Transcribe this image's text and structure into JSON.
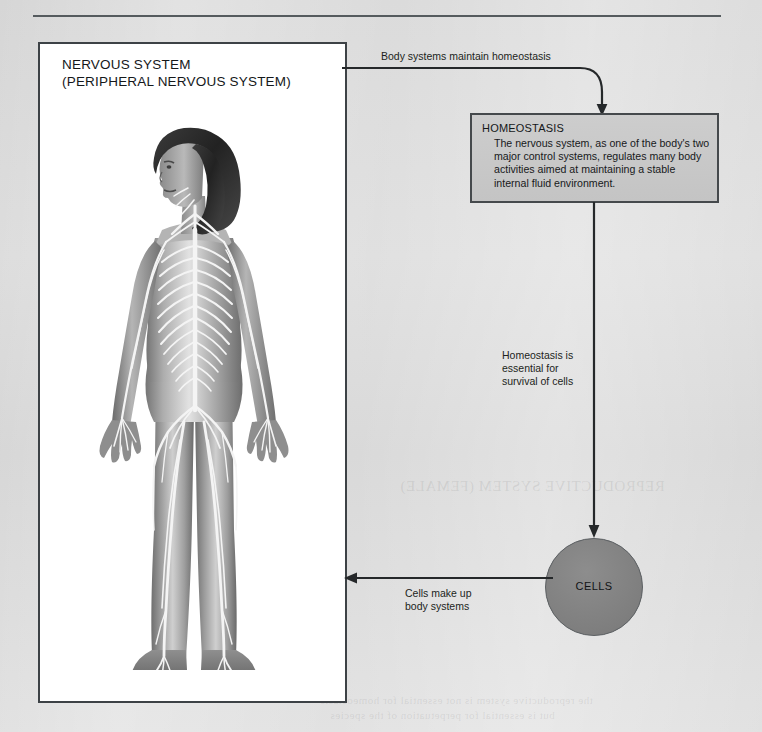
{
  "page": {
    "background_color": "#d8d8d8",
    "rule_color": "#555b5e"
  },
  "nervous_system_panel": {
    "title_line1": "NERVOUS SYSTEM",
    "title_line2": "(PERIPHERAL NERVOUS SYSTEM)",
    "figure_alt": "Anatomical illustration of a woman with the peripheral nervous system highlighted"
  },
  "connectors": {
    "top_label": "Body systems maintain homeostasis",
    "middle_label_line1": "Homeostasis is",
    "middle_label_line2": "essential for",
    "middle_label_line3": "survival of cells",
    "bottom_label_line1": "Cells make up",
    "bottom_label_line2": "body systems"
  },
  "homeostasis_box": {
    "title": "HOMEOSTASIS",
    "body": "The nervous system, as one of the body's two major control systems, regulates many body activities aimed at maintaining a stable internal fluid environment.",
    "fill_color": "#c9c9c9",
    "border_color": "#45494c"
  },
  "cells_node": {
    "label": "CELLS",
    "fill_color": "#858585"
  },
  "bleed_through": {
    "line_right": "REPRODUCTIVE SYSTEM (FEMALE)",
    "line_bottom_1": "the reproductive system is not essential for homeostasis",
    "line_bottom_2": "but is essential for perpetuation of the species"
  }
}
